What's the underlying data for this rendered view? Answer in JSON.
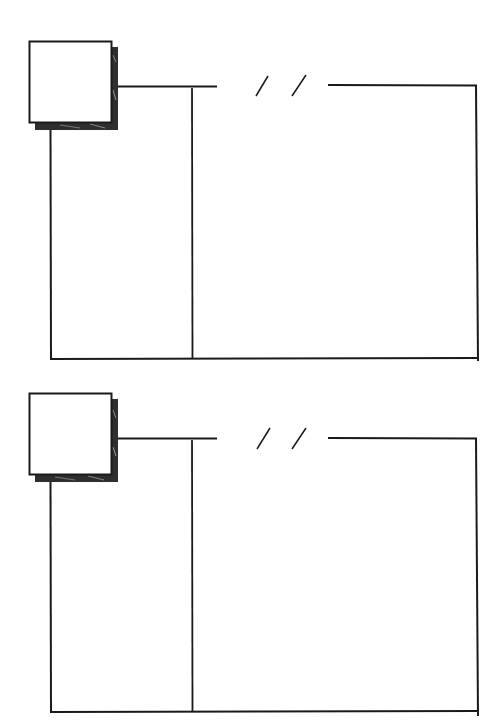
{
  "diagram": {
    "type": "storyboard-sketch-template",
    "stroke_color": "#1a1a1a",
    "shadow_color": "#3a3a3a",
    "background": "#ffffff",
    "panels": [
      {
        "id": "panel-1",
        "offset_y": 0
      },
      {
        "id": "panel-2",
        "offset_y": 352
      }
    ],
    "break_mark": "//"
  }
}
